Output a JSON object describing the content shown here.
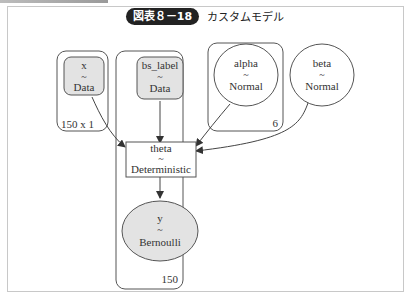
{
  "figure": {
    "badge": "図表８－18",
    "title": "カスタムモデル"
  },
  "plates": [
    {
      "id": "plate-150x1",
      "label": "150 x 1"
    },
    {
      "id": "plate-150",
      "label": "150"
    },
    {
      "id": "plate-6",
      "label": "6"
    }
  ],
  "nodes": {
    "x": {
      "name": "x",
      "tilde": "~",
      "dist": "Data"
    },
    "bs_label": {
      "name": "bs_label",
      "tilde": "~",
      "dist": "Data"
    },
    "alpha": {
      "name": "alpha",
      "tilde": "~",
      "dist": "Normal"
    },
    "beta": {
      "name": "beta",
      "tilde": "~",
      "dist": "Normal"
    },
    "theta": {
      "name": "theta",
      "tilde": "~",
      "dist": "Deterministic"
    },
    "y": {
      "name": "y",
      "tilde": "~",
      "dist": "Bernoulli"
    }
  },
  "edges": [
    {
      "from": "x",
      "to": "theta"
    },
    {
      "from": "bs_label",
      "to": "theta"
    },
    {
      "from": "alpha",
      "to": "theta"
    },
    {
      "from": "beta",
      "to": "theta"
    },
    {
      "from": "theta",
      "to": "y"
    }
  ],
  "colors": {
    "observed_fill": "#e3e3e3",
    "stroke": "#555555",
    "badge_bg": "#222222"
  }
}
